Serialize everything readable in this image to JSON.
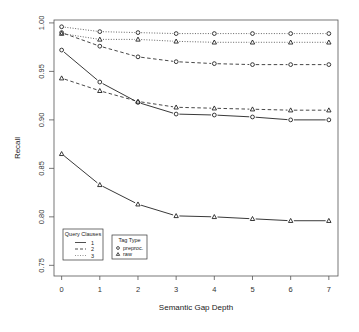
{
  "chart_data": {
    "type": "line",
    "title": "",
    "xlabel": "Semantic Gap Depth",
    "ylabel": "Recall",
    "x": [
      0,
      1,
      2,
      3,
      4,
      5,
      6,
      7
    ],
    "xticks": [
      "0",
      "1",
      "2",
      "3",
      "4",
      "5",
      "6",
      "7"
    ],
    "yticks": [
      "0.75",
      "0.80",
      "0.85",
      "0.90",
      "0.95",
      "1.00"
    ],
    "ytick_values": [
      0.75,
      0.8,
      0.85,
      0.9,
      0.95,
      1.0
    ],
    "xlim": [
      -0.2,
      7.24
    ],
    "ylim": [
      0.739,
      1.003
    ],
    "grid": false,
    "series": [
      {
        "name": "1 clause, preproc.",
        "clauses": "1",
        "tag_type": "preproc.",
        "line": "solid",
        "marker": "circle",
        "values": [
          0.972,
          0.939,
          0.918,
          0.906,
          0.905,
          0.903,
          0.9,
          0.9
        ]
      },
      {
        "name": "1 clause, raw",
        "clauses": "1",
        "tag_type": "raw",
        "line": "solid",
        "marker": "triangle",
        "values": [
          0.865,
          0.833,
          0.813,
          0.801,
          0.8,
          0.798,
          0.796,
          0.796
        ]
      },
      {
        "name": "2 clauses, preproc.",
        "clauses": "2",
        "tag_type": "preproc.",
        "line": "dashed",
        "marker": "circle",
        "values": [
          0.99,
          0.976,
          0.965,
          0.96,
          0.958,
          0.957,
          0.957,
          0.957
        ]
      },
      {
        "name": "2 clauses, raw",
        "clauses": "2",
        "tag_type": "raw",
        "line": "dashed",
        "marker": "triangle",
        "values": [
          0.943,
          0.93,
          0.919,
          0.913,
          0.912,
          0.911,
          0.91,
          0.91
        ]
      },
      {
        "name": "3 clauses, preproc.",
        "clauses": "3",
        "tag_type": "preproc.",
        "line": "dotted",
        "marker": "circle",
        "values": [
          0.996,
          0.991,
          0.99,
          0.989,
          0.989,
          0.989,
          0.989,
          0.989
        ]
      },
      {
        "name": "3 clauses, raw",
        "clauses": "3",
        "tag_type": "raw",
        "line": "dotted",
        "marker": "triangle",
        "values": [
          0.989,
          0.983,
          0.983,
          0.981,
          0.98,
          0.98,
          0.98,
          0.98
        ]
      }
    ],
    "legends": [
      {
        "title": "Query Clauses",
        "placement": "bottom-left",
        "entries": [
          {
            "label": "1",
            "line": "solid"
          },
          {
            "label": "2",
            "line": "dashed"
          },
          {
            "label": "3",
            "line": "dotted"
          }
        ]
      },
      {
        "title": "Tag Type",
        "placement": "bottom-left",
        "entries": [
          {
            "label": "preproc.",
            "marker": "circle"
          },
          {
            "label": "raw",
            "marker": "triangle"
          }
        ]
      }
    ],
    "colors": {
      "line": "#222222",
      "axis": "#444444",
      "background": "#ffffff"
    }
  }
}
